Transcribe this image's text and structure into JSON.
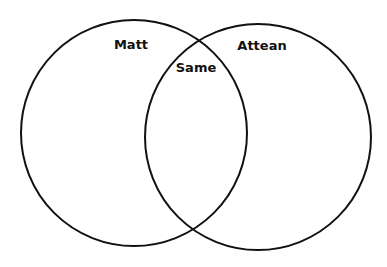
{
  "diagram": {
    "type": "venn",
    "sets": [
      {
        "label": "Matt",
        "cx": 134,
        "cy": 133,
        "r": 113
      },
      {
        "label": "Attean",
        "cx": 258,
        "cy": 137,
        "r": 113
      }
    ],
    "intersection_label": "Same",
    "stroke_color": "#111111",
    "background": "#ffffff"
  }
}
